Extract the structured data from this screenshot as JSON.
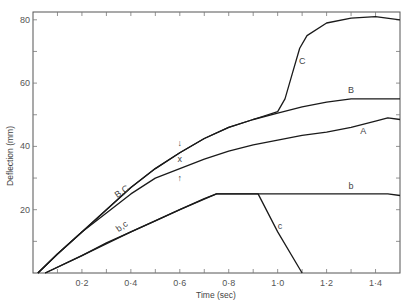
{
  "chart_data": {
    "type": "line",
    "title": "",
    "xlabel": "Time (sec)",
    "ylabel": "Deflection (mm)",
    "xlim": [
      0,
      1.5
    ],
    "ylim": [
      0,
      82
    ],
    "x_ticks": [
      0.2,
      0.4,
      0.6,
      0.8,
      1.0,
      1.2,
      1.4
    ],
    "x_tick_labels": [
      "0·2",
      "0·4",
      "0·6",
      "0·8",
      "1·0",
      "1·2",
      "1·4"
    ],
    "y_ticks": [
      20,
      40,
      60,
      80
    ],
    "y_tick_labels": [
      "20",
      "40",
      "60",
      "80"
    ],
    "grid": false,
    "legend": "none (curves labeled inline)",
    "series": [
      {
        "name": "A",
        "x": [
          0.02,
          0.1,
          0.2,
          0.3,
          0.4,
          0.5,
          0.6,
          0.7,
          0.8,
          0.9,
          1.0,
          1.1,
          1.2,
          1.3,
          1.4,
          1.45,
          1.5
        ],
        "y": [
          0,
          6,
          13,
          19,
          25,
          30,
          33,
          36,
          38.5,
          40.5,
          42,
          43.5,
          44.5,
          46,
          48,
          49,
          48.5
        ]
      },
      {
        "name": "B",
        "x": [
          0.02,
          0.1,
          0.2,
          0.3,
          0.4,
          0.5,
          0.6,
          0.7,
          0.8,
          0.9,
          1.0,
          1.1,
          1.2,
          1.3,
          1.4,
          1.5
        ],
        "y": [
          0,
          6,
          13,
          20,
          27,
          33,
          38,
          42.5,
          46,
          48.5,
          50.5,
          52.5,
          54,
          55,
          55,
          55
        ]
      },
      {
        "name": "C",
        "x": [
          0.02,
          0.1,
          0.2,
          0.3,
          0.4,
          0.5,
          0.6,
          0.7,
          0.8,
          0.9,
          1.0,
          1.03,
          1.06,
          1.09,
          1.12,
          1.2,
          1.3,
          1.4,
          1.5
        ],
        "y": [
          0,
          6,
          13,
          20,
          27,
          33,
          38,
          42.5,
          46,
          48.5,
          51,
          55,
          63,
          71,
          75,
          79,
          80.5,
          81,
          80
        ]
      },
      {
        "name": "b",
        "x": [
          0.05,
          0.2,
          0.3,
          0.4,
          0.5,
          0.6,
          0.7,
          0.75,
          0.8,
          1.0,
          1.2,
          1.4,
          1.45,
          1.5
        ],
        "y": [
          0,
          5.5,
          9.5,
          13,
          16.5,
          20,
          23.5,
          25,
          25,
          25,
          25,
          25,
          25,
          24.5
        ]
      },
      {
        "name": "c",
        "x": [
          0.05,
          0.2,
          0.4,
          0.6,
          0.75,
          0.92,
          1.0,
          1.1
        ],
        "y": [
          0,
          5.5,
          13,
          20,
          25,
          25,
          13,
          0
        ]
      }
    ],
    "annotations": [
      {
        "text": "A",
        "x": 1.35,
        "y": 44
      },
      {
        "text": "B",
        "x": 1.3,
        "y": 57
      },
      {
        "text": "C",
        "x": 1.1,
        "y": 66
      },
      {
        "text": "b",
        "x": 1.3,
        "y": 26.5
      },
      {
        "text": "c",
        "x": 1.01,
        "y": 14
      },
      {
        "text": "B,C",
        "x": 0.37,
        "y": 25
      },
      {
        "text": "b,c",
        "x": 0.37,
        "y": 14
      },
      {
        "text": "x",
        "x": 0.6,
        "y": 35
      },
      {
        "text": "↓",
        "x": 0.6,
        "y": 40
      },
      {
        "text": "↑",
        "x": 0.6,
        "y": 29
      }
    ]
  }
}
